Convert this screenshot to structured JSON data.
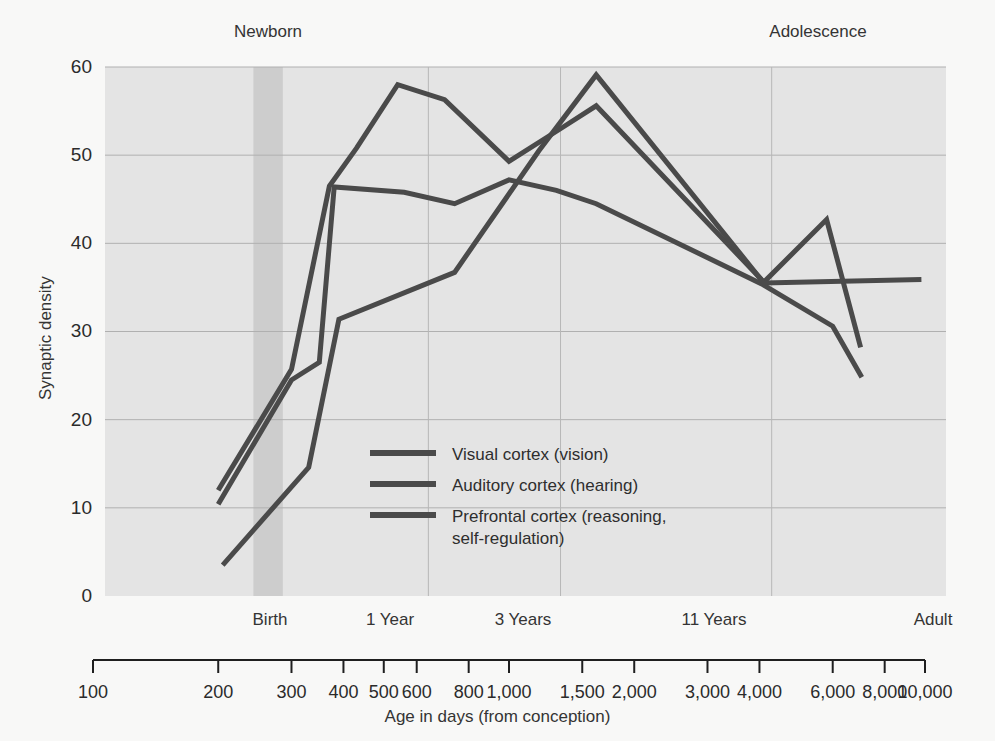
{
  "chart_data": {
    "type": "line",
    "title": "",
    "xlabel": "Age in days (from conception)",
    "ylabel": "Synaptic density",
    "xscale": "log",
    "xlim": [
      100,
      10000
    ],
    "ylim": [
      0,
      60
    ],
    "grid": true,
    "legend_position": "inside-center",
    "x_tick_values": [
      100,
      200,
      300,
      400,
      500,
      600,
      800,
      1000,
      1500,
      2000,
      3000,
      4000,
      6000,
      8000,
      10000
    ],
    "x_tick_labels": [
      "100",
      "200",
      "300",
      "400",
      "500",
      "600",
      "800",
      "1,000",
      "1,500",
      "2,000",
      "3,000",
      "4,000",
      "6,000",
      "8,000",
      "10,000"
    ],
    "y_tick_values": [
      0,
      10,
      20,
      30,
      40,
      50,
      60
    ],
    "y_tick_labels": [
      "0",
      "10",
      "20",
      "30",
      "40",
      "50",
      "60"
    ],
    "stage_labels": [
      {
        "text": "Birth",
        "x": 270
      },
      {
        "text": "1 Year",
        "x": 640
      },
      {
        "text": "3 Years",
        "x": 1330
      },
      {
        "text": "11 Years",
        "x": 4280
      },
      {
        "text": "Adult",
        "x": 9800
      }
    ],
    "era_labels": [
      {
        "text": "Newborn",
        "x": 265
      },
      {
        "text": "Adolescence",
        "x": 5100
      }
    ],
    "highlight_band": {
      "name": "newborn-band",
      "x_start": 243,
      "x_end": 286,
      "color": "#c9c9c9"
    },
    "series": [
      {
        "name": "Visual cortex (vision)",
        "color": "#4a4a4a",
        "points": [
          [
            200,
            12.0
          ],
          [
            300,
            25.7
          ],
          [
            370,
            46.5
          ],
          [
            430,
            50.8
          ],
          [
            540,
            58.0
          ],
          [
            700,
            56.3
          ],
          [
            1000,
            49.3
          ],
          [
            1350,
            53.2
          ],
          [
            1620,
            55.6
          ],
          [
            4100,
            35.6
          ],
          [
            5800,
            42.7
          ],
          [
            7000,
            28.2
          ]
        ]
      },
      {
        "name": "Auditory cortex (hearing)",
        "color": "#4a4a4a",
        "points": [
          [
            200,
            10.4
          ],
          [
            300,
            24.5
          ],
          [
            350,
            26.5
          ],
          [
            380,
            46.4
          ],
          [
            560,
            45.8
          ],
          [
            740,
            44.5
          ],
          [
            1000,
            47.2
          ],
          [
            1300,
            46.0
          ],
          [
            1620,
            44.5
          ],
          [
            4050,
            35.4
          ],
          [
            6000,
            30.6
          ],
          [
            7050,
            24.8
          ]
        ]
      },
      {
        "name": "Prefrontal cortex (reasoning,\nself-regulation)",
        "color": "#4a4a4a",
        "points": [
          [
            205,
            3.5
          ],
          [
            330,
            14.6
          ],
          [
            390,
            31.4
          ],
          [
            740,
            36.7
          ],
          [
            1180,
            50.5
          ],
          [
            1620,
            59.1
          ],
          [
            4100,
            35.5
          ],
          [
            9800,
            35.9
          ]
        ]
      }
    ],
    "legend": [
      {
        "label": "Visual cortex (vision)"
      },
      {
        "label": "Auditory cortex (hearing)"
      },
      {
        "label": "Prefrontal cortex (reasoning,\nself-regulation)"
      }
    ]
  }
}
